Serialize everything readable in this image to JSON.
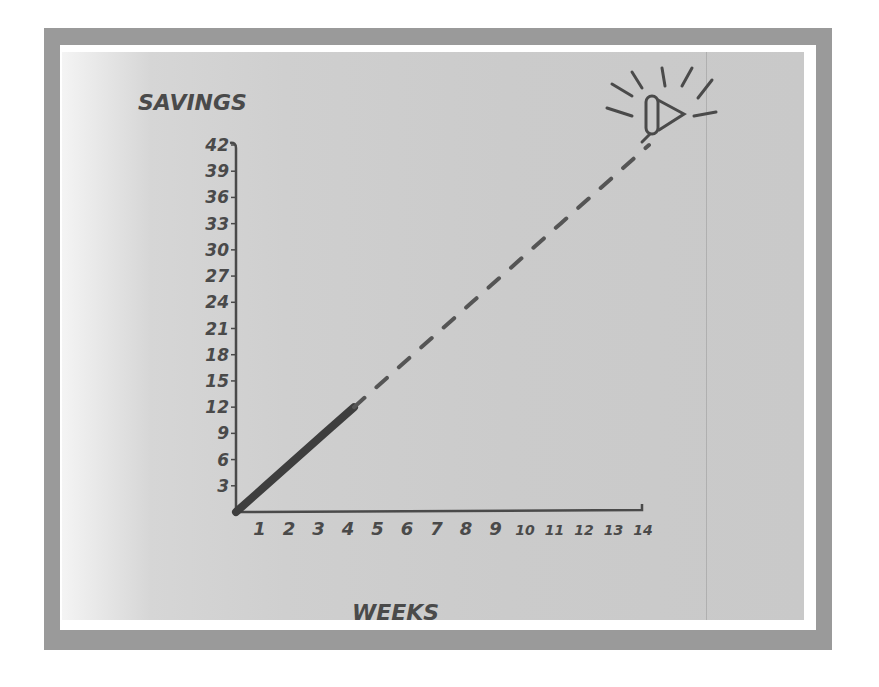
{
  "chart_data": {
    "type": "line",
    "title": "",
    "xlabel": "Weeks",
    "ylabel": "Savings",
    "x_ticks": [
      "1",
      "2",
      "3",
      "4",
      "5",
      "6",
      "7",
      "8",
      "9",
      "10",
      "11",
      "12",
      "13",
      "14"
    ],
    "y_ticks": [
      "3",
      "6",
      "9",
      "12",
      "15",
      "18",
      "21",
      "24",
      "27",
      "30",
      "33",
      "36",
      "39",
      "42"
    ],
    "xlim": [
      0,
      14
    ],
    "ylim": [
      0,
      42
    ],
    "grid": false,
    "legend": null,
    "series": [
      {
        "name": "Actual savings",
        "style": "solid-thick",
        "x": [
          0,
          1,
          2,
          3,
          4
        ],
        "y": [
          0,
          3,
          6,
          9,
          12
        ]
      },
      {
        "name": "Projected savings",
        "style": "dashed",
        "x": [
          4,
          5,
          6,
          7,
          8,
          9,
          10,
          11,
          12,
          13,
          14
        ],
        "y": [
          12,
          15,
          18,
          21,
          24,
          27,
          30,
          33,
          36,
          39,
          42
        ]
      }
    ],
    "annotations": [
      {
        "type": "icon",
        "name": "trumpet-horn-celebration",
        "at": {
          "x": 14,
          "y": 42
        }
      }
    ]
  },
  "labels": {
    "y_axis_title": "SAVINGS",
    "x_axis_title": "WEEKS"
  },
  "colors": {
    "ink": "#4a4a4a",
    "paper": "#cbcbcb",
    "frame": "#9a9a9a"
  }
}
